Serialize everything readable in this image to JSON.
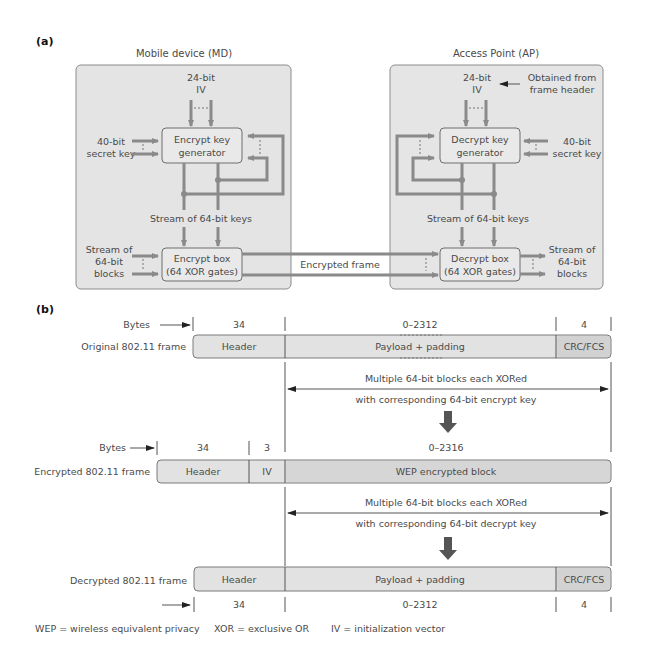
{
  "part_a": {
    "label": "(a)",
    "mobile_device": {
      "title": "Mobile device (MD)",
      "iv_line1": "24-bit",
      "iv_line2": "IV",
      "secret_key_line1": "40-bit",
      "secret_key_line2": "secret key",
      "key_generator_line1": "Encrypt key",
      "key_generator_line2": "generator",
      "key_stream": "Stream of 64-bit keys",
      "blocks_line1": "Stream of",
      "blocks_line2": "64-bit",
      "blocks_line3": "blocks",
      "box_line1": "Encrypt box",
      "box_line2": "(64 XOR gates)"
    },
    "link_label": "Encrypted frame",
    "access_point": {
      "title": "Access Point (AP)",
      "iv_line1": "24-bit",
      "iv_line2": "IV",
      "iv_source_line1": "Obtained from",
      "iv_source_line2": "frame header",
      "secret_key_line1": "40-bit",
      "secret_key_line2": "secret key",
      "key_generator_line1": "Decrypt key",
      "key_generator_line2": "generator",
      "key_stream": "Stream of 64-bit keys",
      "blocks_line1": "Stream of",
      "blocks_line2": "64-bit",
      "blocks_line3": "blocks",
      "box_line1": "Decrypt box",
      "box_line2": "(64 XOR gates)"
    }
  },
  "part_b": {
    "label": "(b)",
    "bytes_label": "Bytes",
    "original_frame": {
      "label": "Original 802.11 frame",
      "fields": [
        {
          "name": "Header",
          "bytes": "34"
        },
        {
          "name": "Payload + padding",
          "bytes": "0–2312"
        },
        {
          "name": "CRC/FCS",
          "bytes": "4"
        }
      ]
    },
    "encrypt_note_line1": "Multiple 64-bit blocks each XORed",
    "encrypt_note_line2": "with corresponding 64-bit encrypt key",
    "encrypted_frame": {
      "label": "Encrypted 802.11 frame",
      "fields": [
        {
          "name": "Header",
          "bytes": "34"
        },
        {
          "name": "IV",
          "bytes": "3"
        },
        {
          "name": "WEP encrypted block",
          "bytes": "0–2316"
        }
      ]
    },
    "decrypt_note_line1": "Multiple 64-bit blocks each XORed",
    "decrypt_note_line2": "with corresponding 64-bit decrypt key",
    "decrypted_frame": {
      "label": "Decrypted 802.11 frame",
      "fields": [
        {
          "name": "Header",
          "bytes": "34"
        },
        {
          "name": "Payload + padding",
          "bytes": "0–2312"
        },
        {
          "name": "CRC/FCS",
          "bytes": "4"
        }
      ]
    }
  },
  "legend": {
    "wep": "WEP = wireless equivalent privacy",
    "xor": "XOR = exclusive OR",
    "iv": "IV = initialization vector"
  },
  "colors": {
    "panel_fill": "#e4e4e4",
    "pipe": "#8a8a8a",
    "text": "#4a4a4a"
  }
}
